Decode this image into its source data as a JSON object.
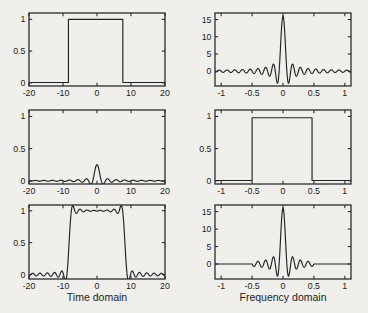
{
  "figure": {
    "background_color": "#f1efeb",
    "axis_color": "#2b2b2b",
    "curve_color": "#232323",
    "text_color": "#1b1b1b"
  },
  "chart_data": [
    {
      "name": "rect-pulse-time",
      "type": "line",
      "position": {
        "row": 0,
        "col": 0
      },
      "signal": "rect",
      "xlim": [
        -20,
        20
      ],
      "ylim": [
        -0.05,
        1.1
      ],
      "xticks": [
        -20,
        -10,
        0,
        10,
        20
      ],
      "xtick_labels": [
        "-20",
        "-10",
        "0",
        "10",
        "20"
      ],
      "yticks": [
        0,
        0.5,
        1
      ],
      "ytick_labels": [
        "0",
        "0.5",
        "1"
      ],
      "xlabel": "",
      "peak": 1,
      "params": {
        "edge_left": -8.4,
        "edge_right": 7.6,
        "height": 1,
        "base": 0.005
      }
    },
    {
      "name": "sinc-frequency-full",
      "type": "line",
      "position": {
        "row": 0,
        "col": 1
      },
      "signal": "sinc",
      "xlim": [
        -1.1,
        1.1
      ],
      "ylim": [
        -4.3,
        16.9
      ],
      "xticks": [
        -1,
        -0.5,
        0,
        0.5,
        1
      ],
      "xtick_labels": [
        "-1",
        "-0.5",
        "0",
        "0.5",
        "1"
      ],
      "yticks": [
        0,
        5,
        10,
        15
      ],
      "ytick_labels": [
        "0",
        "5",
        "10",
        "15"
      ],
      "xlabel": "",
      "peak": 16,
      "params": {
        "amplitude": 16,
        "zero_spacing": 0.0625
      }
    },
    {
      "name": "sinc-time-small",
      "type": "line",
      "position": {
        "row": 1,
        "col": 0
      },
      "signal": "sinc",
      "xlim": [
        -20,
        20
      ],
      "ylim": [
        -0.05,
        1.1
      ],
      "xticks": [
        -20,
        -10,
        0,
        10,
        20
      ],
      "xtick_labels": [
        "-20",
        "-10",
        "0",
        "10",
        "20"
      ],
      "yticks": [
        0,
        0.5,
        1
      ],
      "ytick_labels": [
        "0",
        "0.5",
        "1"
      ],
      "xlabel": "",
      "peak": 0.25,
      "params": {
        "amplitude": 0.25,
        "zero_spacing": 1.25
      }
    },
    {
      "name": "rect-pulse-frequency",
      "type": "line",
      "position": {
        "row": 1,
        "col": 1
      },
      "signal": "rect",
      "xlim": [
        -1.1,
        1.1
      ],
      "ylim": [
        -0.05,
        1.1
      ],
      "xticks": [
        -1,
        -0.5,
        0,
        0.5,
        1
      ],
      "xtick_labels": [
        "-1",
        "-0.5",
        "0",
        "0.5",
        "1"
      ],
      "yticks": [
        0,
        0.5,
        1
      ],
      "ytick_labels": [
        "0",
        "0.5",
        "1"
      ],
      "xlabel": "",
      "peak": 1,
      "params": {
        "edge_left": -0.5,
        "edge_right": 0.47,
        "height": 0.98,
        "base": 0.005
      }
    },
    {
      "name": "gibbs-reconstruction-time",
      "type": "line",
      "position": {
        "row": 2,
        "col": 0
      },
      "signal": "fourier_partial_sum",
      "xlim": [
        -20,
        20
      ],
      "ylim": [
        -0.07,
        1.09
      ],
      "xticks": [
        -20,
        -10,
        0,
        10,
        20
      ],
      "xtick_labels": [
        "-20",
        "-10",
        "0",
        "10",
        "20"
      ],
      "yticks": [
        0,
        0.5,
        1
      ],
      "ytick_labels": [
        "0",
        "0.5",
        "1"
      ],
      "xlabel": "Time domain",
      "peak": 1,
      "params": {
        "half_width": 8.2,
        "height": 1,
        "period": 40,
        "harmonics": 18
      }
    },
    {
      "name": "windowed-sinc-frequency",
      "type": "line",
      "position": {
        "row": 2,
        "col": 1
      },
      "signal": "windowed_sinc",
      "xlim": [
        -1.1,
        1.1
      ],
      "ylim": [
        -4.3,
        16.9
      ],
      "xticks": [
        -1,
        -0.5,
        0,
        0.5,
        1
      ],
      "xtick_labels": [
        "-1",
        "-0.5",
        "0",
        "0.5",
        "1"
      ],
      "yticks": [
        0,
        5,
        10,
        15
      ],
      "ytick_labels": [
        "0",
        "5",
        "10",
        "15"
      ],
      "xlabel": "Frequency domain",
      "peak": 16,
      "params": {
        "amplitude": 16,
        "zero_spacing": 0.0625,
        "window_left": -0.5,
        "window_right": 0.5
      }
    }
  ]
}
